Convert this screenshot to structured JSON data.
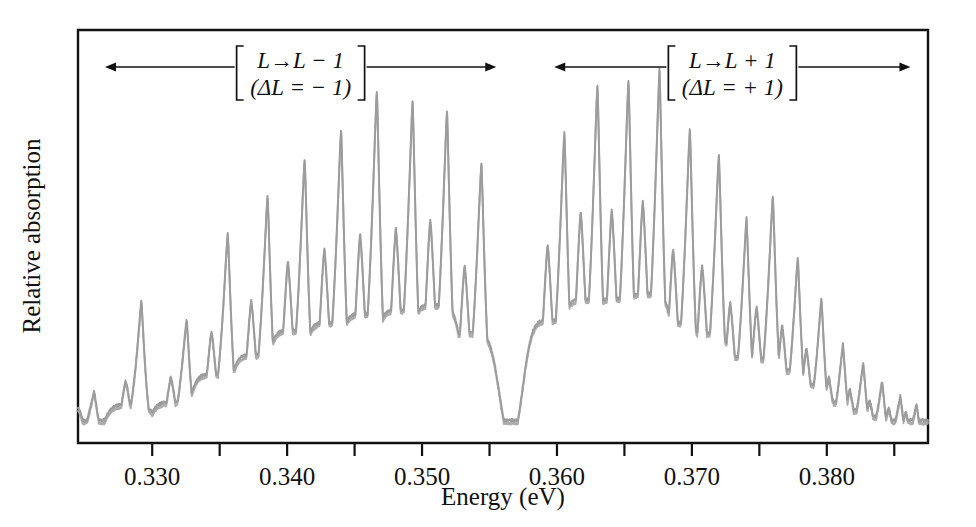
{
  "figure": {
    "background_color": "#ffffff",
    "frame_color": "#111111",
    "trace_color": "#9c9c9c"
  },
  "axes": {
    "x_title": "Energy (eV)",
    "y_title": "Relative absorption",
    "x_major_ticks": [
      {
        "value": 0.33,
        "label": "0.330"
      },
      {
        "value": 0.34,
        "label": "0.340"
      },
      {
        "value": 0.35,
        "label": "0.350"
      },
      {
        "value": 0.36,
        "label": "0.360"
      },
      {
        "value": 0.37,
        "label": "0.370"
      },
      {
        "value": 0.38,
        "label": "0.380"
      }
    ],
    "x_minor_ticks": [
      0.335,
      0.345,
      0.355,
      0.365,
      0.375,
      0.385
    ],
    "x_range": [
      0.3245,
      0.3875
    ],
    "y_range": [
      0,
      1
    ],
    "y_ticks_shown": false,
    "grid": false
  },
  "annotations": [
    {
      "name": "branch-minus",
      "line1_pre": "L",
      "line1_arrow": "→",
      "line1_post": "L − 1",
      "line2": "(ΔL = − 1)",
      "bracket": true,
      "arrow_left_x": 0.3265,
      "arrow_right_x": 0.3555,
      "center_x": 0.341
    },
    {
      "name": "branch-plus",
      "line1_pre": "L",
      "line1_arrow": "→",
      "line1_post": "L + 1",
      "line2": "(ΔL = + 1)",
      "bracket": true,
      "arrow_left_x": 0.3598,
      "arrow_right_x": 0.3862,
      "center_x": 0.373
    }
  ],
  "chart_data": {
    "type": "line",
    "title": "",
    "xlabel": "Energy (eV)",
    "ylabel": "Relative absorption",
    "xlim": [
      0.3245,
      0.3875
    ],
    "ylim": [
      0,
      1
    ],
    "grid": false,
    "legend": null,
    "baseline": 0.055,
    "series": [
      {
        "name": "absorption",
        "color": "#9c9c9c",
        "peaks": [
          {
            "x": 0.3257,
            "height": 0.125,
            "shoulder": 0.085,
            "width": 0.00075
          },
          {
            "x": 0.3292,
            "height": 0.345,
            "shoulder": 0.15,
            "width": 0.00075
          },
          {
            "x": 0.33255,
            "height": 0.3,
            "shoulder": 0.16,
            "width": 0.00075
          },
          {
            "x": 0.3356,
            "height": 0.51,
            "shoulder": 0.27,
            "width": 0.00078
          },
          {
            "x": 0.33855,
            "height": 0.6,
            "shoulder": 0.345,
            "width": 0.00078
          },
          {
            "x": 0.3413,
            "height": 0.69,
            "shoulder": 0.44,
            "width": 0.0008
          },
          {
            "x": 0.344,
            "height": 0.76,
            "shoulder": 0.47,
            "width": 0.0008
          },
          {
            "x": 0.34665,
            "height": 0.855,
            "shoulder": 0.505,
            "width": 0.0008
          },
          {
            "x": 0.3493,
            "height": 0.83,
            "shoulder": 0.52,
            "width": 0.0008
          },
          {
            "x": 0.35185,
            "height": 0.805,
            "shoulder": 0.54,
            "width": 0.0008
          },
          {
            "x": 0.3544,
            "height": 0.68,
            "shoulder": 0.43,
            "width": 0.0008
          },
          {
            "x": 0.36055,
            "height": 0.755,
            "shoulder": 0.48,
            "width": 0.0008
          },
          {
            "x": 0.363,
            "height": 0.87,
            "shoulder": 0.56,
            "width": 0.0008
          },
          {
            "x": 0.3653,
            "height": 0.88,
            "shoulder": 0.565,
            "width": 0.0008
          },
          {
            "x": 0.3676,
            "height": 0.905,
            "shoulder": 0.585,
            "width": 0.0008
          },
          {
            "x": 0.36985,
            "height": 0.76,
            "shoulder": 0.47,
            "width": 0.0008
          },
          {
            "x": 0.372,
            "height": 0.7,
            "shoulder": 0.43,
            "width": 0.0008
          },
          {
            "x": 0.37405,
            "height": 0.545,
            "shoulder": 0.34,
            "width": 0.00078
          },
          {
            "x": 0.376,
            "height": 0.6,
            "shoulder": 0.33,
            "width": 0.00078
          },
          {
            "x": 0.37785,
            "height": 0.45,
            "shoulder": 0.285,
            "width": 0.00075
          },
          {
            "x": 0.3796,
            "height": 0.35,
            "shoulder": 0.23,
            "width": 0.00072
          },
          {
            "x": 0.3812,
            "height": 0.24,
            "shoulder": 0.16,
            "width": 0.00068
          },
          {
            "x": 0.3827,
            "height": 0.195,
            "shoulder": 0.13,
            "width": 0.00064
          },
          {
            "x": 0.3841,
            "height": 0.15,
            "shoulder": 0.105,
            "width": 0.0006
          },
          {
            "x": 0.38545,
            "height": 0.115,
            "shoulder": 0.085,
            "width": 0.00056
          },
          {
            "x": 0.38665,
            "height": 0.095,
            "shoulder": 0.075,
            "width": 0.00052
          }
        ]
      }
    ]
  }
}
